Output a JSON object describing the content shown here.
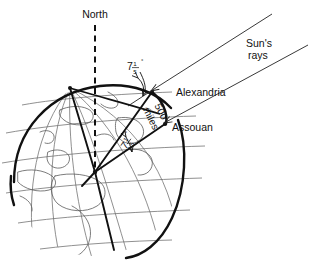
{
  "figure": {
    "title_visible": false,
    "background_color": "#ffffff",
    "ink_color": "#111111",
    "grid_color": "#6b6b6b"
  },
  "labels": {
    "north": "North",
    "sun_rays_line1": "Sun's",
    "sun_rays_line2": "rays",
    "alexandria": "Alexandria",
    "assouan": "Assouan",
    "arc_distance_number": "500",
    "arc_distance_unit": "miles"
  },
  "angles": {
    "top": {
      "whole": "7",
      "numerator": "1",
      "denominator": "5",
      "degree_symbol": "°",
      "text": "7 1/5°"
    },
    "center": {
      "whole": "7",
      "numerator": "1",
      "denominator": "5",
      "degree_symbol": "°",
      "text": "7 1/5°"
    }
  },
  "icons": {
    "sun_ray_arrow": "arrow-left-down-icon",
    "angle_arc_arrow": "angle-arrow-icon",
    "north_axis": "dashed-axis-icon"
  },
  "geometry": {
    "earth_center": [
      95,
      172
    ],
    "north_pole_node": [
      70,
      88
    ],
    "alexandria_point": [
      152,
      92
    ],
    "assouan_point": [
      165,
      124
    ],
    "globe_radius": 84
  }
}
